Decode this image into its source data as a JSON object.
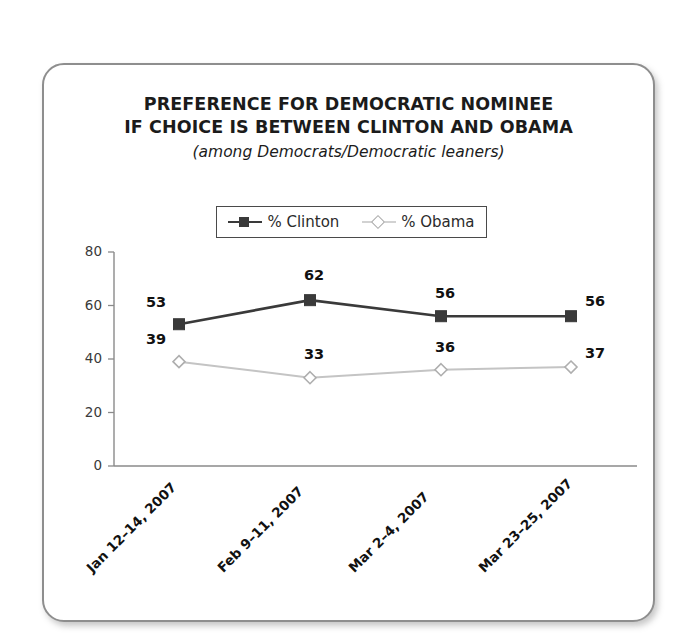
{
  "card": {
    "border_color": "#8e8e8e"
  },
  "chart_data": {
    "type": "line",
    "title_line1": "PREFERENCE FOR DEMOCRATIC NOMINEE",
    "title_line2": "IF CHOICE IS BETWEEN CLINTON AND OBAMA",
    "subtitle": "(among Democrats/Democratic leaners)",
    "categories": [
      "Jan 12–14, 2007",
      "Feb 9–11, 2007",
      "Mar 2–4, 2007",
      "Mar 23–25, 2007"
    ],
    "series": [
      {
        "name": "% Clinton",
        "values": [
          53,
          62,
          56,
          56
        ],
        "color": "#3a3a3a",
        "marker": "square"
      },
      {
        "name": "% Obama",
        "values": [
          39,
          33,
          36,
          37
        ],
        "color": "#c4c4c4",
        "marker": "diamond"
      }
    ],
    "yticks": [
      80,
      60,
      40,
      20,
      0
    ],
    "ylim": [
      0,
      80
    ],
    "xlabel": "",
    "ylabel": "",
    "grid": false,
    "legend_position": "top-center"
  },
  "labels": {
    "clinton": [
      "53",
      "62",
      "56",
      "56"
    ],
    "obama": [
      "39",
      "33",
      "36",
      "37"
    ],
    "yticks": [
      "80",
      "60",
      "40",
      "20",
      "0"
    ]
  }
}
